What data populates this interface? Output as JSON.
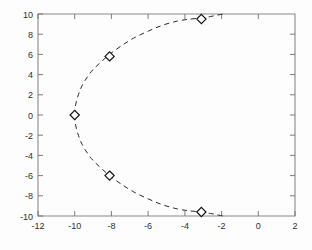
{
  "chart_data": {
    "type": "line",
    "title": "",
    "xlabel": "",
    "ylabel": "",
    "xlim": [
      -12,
      2
    ],
    "ylim": [
      -10,
      10
    ],
    "xticks": [
      -12,
      -10,
      -8,
      -6,
      -4,
      -2,
      0,
      2
    ],
    "ytick_labels": [
      "10",
      "8",
      "6",
      "4",
      "2",
      "0",
      "-2",
      "-4",
      "-6",
      "-8",
      "-10"
    ],
    "xtick_labels": [
      "-12",
      "-10",
      "-8",
      "-6",
      "-4",
      "-2",
      "0",
      "2"
    ],
    "yticks": [
      10,
      8,
      6,
      4,
      2,
      0,
      -2,
      -4,
      -6,
      -8,
      -10
    ],
    "grid": false,
    "legend": null,
    "series": [
      {
        "name": "root-locus-branch",
        "linestyle": "dashed",
        "color": "#2b2b2b",
        "marker": "diamond",
        "x": [
          -10.0,
          -9.95,
          -9.8,
          -9.6,
          -9.3,
          -9.0,
          -8.6,
          -8.1,
          -7.5,
          -6.8,
          -6.0,
          -5.2,
          -4.4,
          -3.7,
          -3.1,
          -2.6,
          -2.2,
          -1.9
        ],
        "y": [
          0.0,
          1.0,
          2.0,
          2.9,
          3.8,
          4.5,
          5.2,
          6.0,
          6.8,
          7.6,
          8.3,
          8.9,
          9.3,
          9.5,
          9.6,
          9.75,
          9.9,
          10.0
        ]
      },
      {
        "name": "root-locus-branch-conjugate",
        "linestyle": "dashed",
        "color": "#2b2b2b",
        "marker": "diamond",
        "x": [
          -10.0,
          -9.95,
          -9.8,
          -9.6,
          -9.3,
          -9.0,
          -8.6,
          -8.1,
          -7.5,
          -6.8,
          -6.0,
          -5.2,
          -4.4,
          -3.7,
          -3.1,
          -2.6,
          -2.2,
          -1.9
        ],
        "y": [
          0.0,
          -1.0,
          -2.0,
          -2.9,
          -3.8,
          -4.5,
          -5.2,
          -6.0,
          -6.8,
          -7.6,
          -8.3,
          -8.9,
          -9.3,
          -9.5,
          -9.6,
          -9.75,
          -9.9,
          -10.0
        ]
      }
    ],
    "markers": [
      {
        "x": -3.1,
        "y": 9.5
      },
      {
        "x": -8.1,
        "y": 5.8
      },
      {
        "x": -10.0,
        "y": 0.0
      },
      {
        "x": -8.1,
        "y": -6.0
      },
      {
        "x": -3.1,
        "y": -9.6
      }
    ]
  }
}
